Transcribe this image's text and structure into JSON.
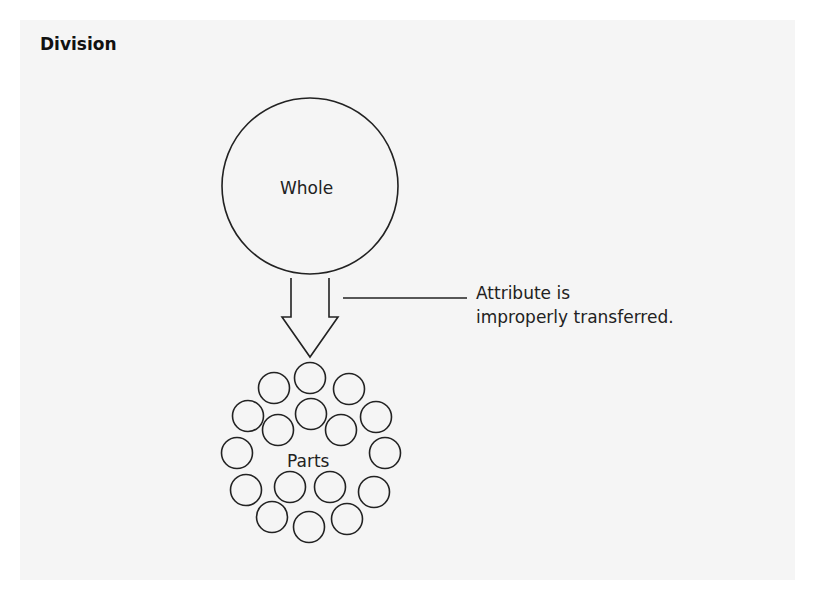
{
  "title": "Division",
  "whole_label": "Whole",
  "parts_label": "Parts",
  "annotation": {
    "line1": "Attribute is",
    "line2": "improperly transferred."
  },
  "parts_circles": [
    [
      310,
      378
    ],
    [
      274,
      388
    ],
    [
      349,
      389
    ],
    [
      248,
      416
    ],
    [
      311,
      414
    ],
    [
      376,
      417
    ],
    [
      278,
      430
    ],
    [
      341,
      430
    ],
    [
      237,
      453
    ],
    [
      385,
      453
    ],
    [
      246,
      490
    ],
    [
      290,
      487
    ],
    [
      330,
      487
    ],
    [
      374,
      492
    ],
    [
      272,
      517
    ],
    [
      309,
      527
    ],
    [
      347,
      519
    ]
  ],
  "colors": {
    "stroke": "#222222",
    "background": "#f5f5f5"
  }
}
